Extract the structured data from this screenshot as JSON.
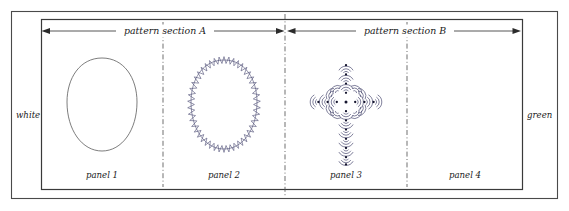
{
  "figure": {
    "type": "technical-pattern-layout-diagram",
    "edge_labels": {
      "left": "white",
      "right": "green"
    },
    "sections": [
      {
        "id": "A",
        "label": "pattern section A"
      },
      {
        "id": "B",
        "label": "pattern section B"
      }
    ],
    "panels": [
      {
        "id": 1,
        "label": "panel 1",
        "motif": "plain-oval"
      },
      {
        "id": 2,
        "label": "panel 2",
        "motif": "zigzag-edged-oval"
      },
      {
        "id": 3,
        "label": "panel 3",
        "motif": "dotted-frond-cross"
      },
      {
        "id": 4,
        "label": "panel 4",
        "motif": "empty"
      }
    ],
    "colors": {
      "frame_outer": "#4a4a4a",
      "frame_inner": "#3a3a3a",
      "divider": "#555555",
      "arrow": "#2b2b2b",
      "motif_stroke": "#3d3d66",
      "motif_dot": "#15152e",
      "oval_plain": "#666666",
      "background": "#ffffff"
    }
  },
  "chart_data": {
    "type": "table",
    "title": "",
    "categories": [
      "panel 1",
      "panel 2",
      "panel 3",
      "panel 4"
    ],
    "series": [
      {
        "name": "section",
        "values": [
          "A",
          "A",
          "B",
          "B"
        ]
      },
      {
        "name": "motif",
        "values": [
          "plain oval",
          "zigzag-edged oval",
          "dotted frond cross",
          "empty"
        ]
      }
    ],
    "annotations": [
      "white",
      "green",
      "pattern section A",
      "pattern section B"
    ]
  }
}
